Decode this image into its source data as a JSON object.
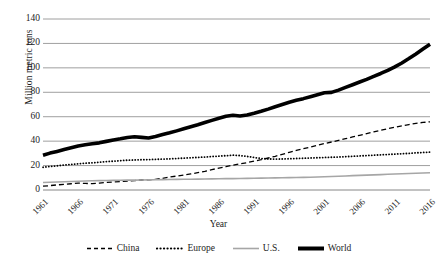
{
  "chart_data": {
    "type": "line",
    "title": "",
    "xlabel": "Year",
    "ylabel": "Million metric tons",
    "grid": true,
    "legend_position": "bottom",
    "xlim": [
      1961,
      2016
    ],
    "ylim": [
      0,
      140
    ],
    "yticks": [
      0,
      20,
      40,
      60,
      80,
      100,
      120,
      140
    ],
    "xticks": [
      1961,
      1966,
      1971,
      1976,
      1981,
      1986,
      1991,
      1996,
      2001,
      2006,
      2011,
      2016
    ],
    "x": [
      1961,
      1962,
      1963,
      1964,
      1965,
      1966,
      1967,
      1968,
      1969,
      1970,
      1971,
      1972,
      1973,
      1974,
      1975,
      1976,
      1977,
      1978,
      1979,
      1980,
      1981,
      1982,
      1983,
      1984,
      1985,
      1986,
      1987,
      1988,
      1989,
      1990,
      1991,
      1992,
      1993,
      1994,
      1995,
      1996,
      1997,
      1998,
      1999,
      2000,
      2001,
      2002,
      2003,
      2004,
      2005,
      2006,
      2007,
      2008,
      2009,
      2010,
      2011,
      2012,
      2013,
      2014,
      2015,
      2016
    ],
    "series": [
      {
        "name": "China",
        "style": "dashed",
        "color": "#000000",
        "width": 1.3,
        "values": [
          3.1,
          3.6,
          4.2,
          4.6,
          5.1,
          5.6,
          5.4,
          5.2,
          5.6,
          6.2,
          6.6,
          6.9,
          7.3,
          7.7,
          8.2,
          8.4,
          8.7,
          9.6,
          10.6,
          11.4,
          12.3,
          13.2,
          14.2,
          15.3,
          16.7,
          17.9,
          19.1,
          20.4,
          21.4,
          22.4,
          23.6,
          24.8,
          26.2,
          27.6,
          29.2,
          30.8,
          32.4,
          33.8,
          35.2,
          36.6,
          38.0,
          39.3,
          40.6,
          42.0,
          43.4,
          44.8,
          46.2,
          47.6,
          48.9,
          50.2,
          51.4,
          52.5,
          53.6,
          54.6,
          55.3,
          55.8
        ]
      },
      {
        "name": "Europe",
        "style": "dotted",
        "color": "#000000",
        "width": 1.8,
        "values": [
          18.6,
          19.2,
          19.8,
          20.4,
          21.0,
          21.4,
          21.9,
          22.3,
          22.7,
          23.2,
          23.6,
          24.0,
          24.4,
          24.6,
          24.8,
          24.9,
          25.1,
          25.3,
          25.5,
          25.8,
          26.1,
          26.4,
          26.7,
          27.0,
          27.4,
          27.7,
          28.1,
          28.5,
          28.2,
          27.5,
          26.6,
          25.8,
          25.4,
          25.3,
          25.4,
          25.6,
          25.8,
          26.0,
          26.2,
          26.4,
          26.6,
          26.8,
          27.0,
          27.3,
          27.6,
          27.9,
          28.2,
          28.5,
          28.8,
          29.1,
          29.4,
          29.7,
          30.0,
          30.4,
          30.7,
          31.0
        ]
      },
      {
        "name": "U.S.",
        "style": "solid",
        "color": "#a6a6a6",
        "width": 1.6,
        "values": [
          6.2,
          6.4,
          6.6,
          6.8,
          7.0,
          7.2,
          7.4,
          7.6,
          7.7,
          7.8,
          7.9,
          8.0,
          8.1,
          8.1,
          8.2,
          8.3,
          8.4,
          8.5,
          8.6,
          8.7,
          8.8,
          8.8,
          8.9,
          9.0,
          9.1,
          9.2,
          9.3,
          9.3,
          9.4,
          9.5,
          9.6,
          9.7,
          9.8,
          9.9,
          10.0,
          10.1,
          10.2,
          10.3,
          10.4,
          10.6,
          10.8,
          11.0,
          11.2,
          11.5,
          11.8,
          12.0,
          12.2,
          12.4,
          12.6,
          12.9,
          13.1,
          13.3,
          13.5,
          13.7,
          13.9,
          14.1
        ]
      },
      {
        "name": "World",
        "style": "solid",
        "color": "#000000",
        "width": 3.6,
        "values": [
          28.4,
          30.2,
          31.6,
          33.1,
          34.6,
          36.1,
          37.0,
          37.8,
          38.6,
          39.8,
          41.0,
          41.9,
          43.0,
          43.6,
          43.1,
          42.6,
          43.8,
          45.4,
          46.8,
          48.4,
          50.1,
          51.8,
          53.4,
          55.2,
          57.0,
          58.8,
          60.4,
          61.2,
          60.6,
          61.4,
          62.8,
          64.4,
          66.2,
          68.2,
          70.0,
          71.8,
          73.4,
          74.8,
          76.4,
          78.0,
          79.6,
          79.9,
          81.8,
          84.0,
          86.2,
          88.4,
          90.6,
          93.0,
          95.4,
          98.0,
          100.8,
          104.0,
          107.6,
          111.4,
          115.4,
          119.4
        ]
      }
    ]
  },
  "axis": {
    "ylabel": "Million metric tons",
    "xlabel": "Year",
    "ytick_labels": [
      "140",
      "120",
      "100",
      "80",
      "60",
      "40",
      "20",
      "0"
    ],
    "xtick_labels": [
      "1961",
      "1966",
      "1971",
      "1976",
      "1981",
      "1986",
      "1991",
      "1996",
      "2001",
      "2006",
      "2011",
      "2016"
    ]
  },
  "legend": {
    "items": [
      {
        "label": "China",
        "style": "dashed",
        "color": "#000000"
      },
      {
        "label": "Europe",
        "style": "dotted",
        "color": "#000000"
      },
      {
        "label": "U.S.",
        "style": "solid",
        "color": "#a6a6a6"
      },
      {
        "label": "World",
        "style": "solid-thick",
        "color": "#000000"
      }
    ]
  }
}
